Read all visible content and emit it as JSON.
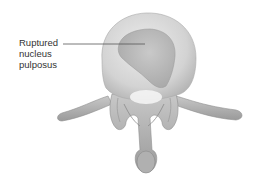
{
  "diagram": {
    "labels": [
      {
        "id": "ruptured-nucleus-pulposus",
        "lines": [
          "Ruptured",
          "nucleus",
          "pulposus"
        ]
      }
    ],
    "colors": {
      "background": "#ffffff",
      "disc_outer": "#d6d6d6",
      "disc_inner": "#b9b9b9",
      "bone": "#a8a8a8",
      "leader_line": "#555555",
      "label_text": "#333333"
    }
  }
}
